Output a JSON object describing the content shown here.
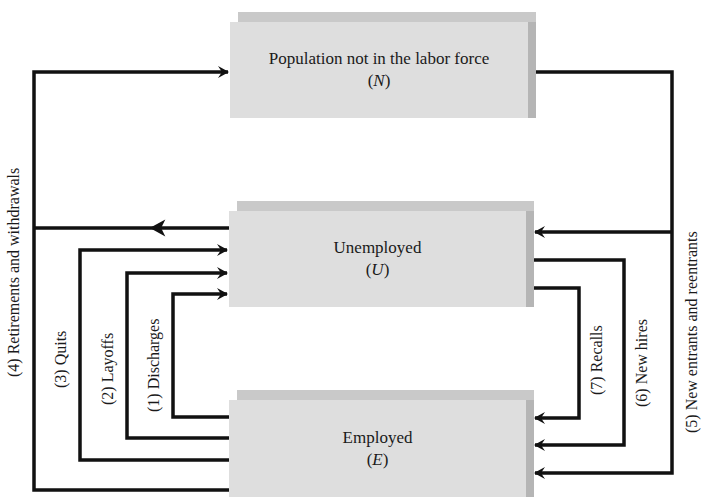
{
  "diagram": {
    "type": "flow-diagram",
    "nodes": [
      {
        "id": "N",
        "label": "Population not in the labor force",
        "symbol_prefix": "(",
        "symbol": "N",
        "symbol_suffix": ")"
      },
      {
        "id": "U",
        "label": "Unemployed",
        "symbol_prefix": "(",
        "symbol": "U",
        "symbol_suffix": ")"
      },
      {
        "id": "E",
        "label": "Employed",
        "symbol_prefix": "(",
        "symbol": "E",
        "symbol_suffix": ")"
      }
    ],
    "flows": [
      {
        "number": 1,
        "label": "(1) Discharges",
        "from": "E",
        "to": "U"
      },
      {
        "number": 2,
        "label": "(2) Layoffs",
        "from": "E",
        "to": "U"
      },
      {
        "number": 3,
        "label": "(3) Quits",
        "from": "E",
        "to": "U"
      },
      {
        "number": 4,
        "label": "(4) Retirements and withdrawals",
        "from": "E,U",
        "to": "N"
      },
      {
        "number": 5,
        "label": "(5) New entrants and reentrants",
        "from": "N",
        "to": "U,E"
      },
      {
        "number": 6,
        "label": "(6) New hires",
        "from": "U",
        "to": "E"
      },
      {
        "number": 7,
        "label": "(7) Recalls",
        "from": "U",
        "to": "E"
      }
    ],
    "colors": {
      "box_face": "#dedede",
      "box_top": "#c9c9c9",
      "box_side": "#b5b5b5",
      "line": "#111111"
    }
  }
}
